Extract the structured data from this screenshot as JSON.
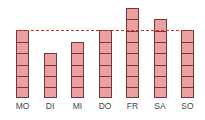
{
  "chart_data": {
    "type": "bar",
    "title": "",
    "xlabel": "",
    "ylabel": "",
    "categories": [
      "MO",
      "DI",
      "MI",
      "DO",
      "FR",
      "SA",
      "SO"
    ],
    "values": [
      6,
      4,
      5,
      6,
      8,
      7,
      6
    ],
    "reference_line": 6,
    "bar_style": "stacked unit blocks",
    "colors": {
      "bar_fill": "#eea0a0",
      "bar_border": "#6e3a3a",
      "reference_line": "#c0392b"
    },
    "grid": false,
    "ylim": [
      0,
      8
    ]
  }
}
